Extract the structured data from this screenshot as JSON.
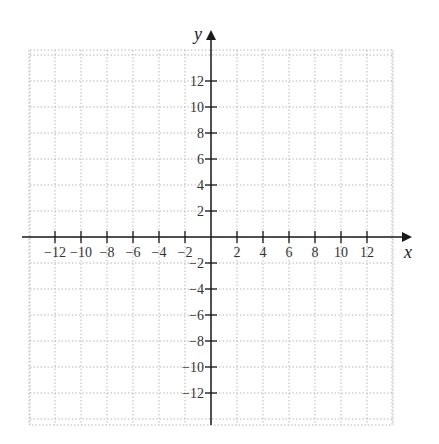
{
  "chart_data": {
    "type": "scatter",
    "title": "",
    "xlabel": "x",
    "ylabel": "y",
    "xlim": [
      -14,
      14
    ],
    "ylim": [
      -14,
      14
    ],
    "grid": true,
    "grid_style": "dotted",
    "x_ticks": [
      -12,
      -10,
      -8,
      -6,
      -4,
      -2,
      2,
      4,
      6,
      8,
      10,
      12
    ],
    "y_ticks": [
      12,
      10,
      8,
      6,
      4,
      2,
      -2,
      -4,
      -6,
      -8,
      -10,
      -12
    ],
    "x_tick_labels": [
      "−12",
      "−10",
      "−8",
      "−6",
      "−4",
      "−2",
      "2",
      "4",
      "6",
      "8",
      "10",
      "12"
    ],
    "y_tick_labels": [
      "12",
      "10",
      "8",
      "6",
      "4",
      "2",
      "−2",
      "−4",
      "−6",
      "−8",
      "−10",
      "−12"
    ],
    "series": [],
    "legend": null
  },
  "colors": {
    "axis": "#1a1a1a",
    "grid": "#b8b8b8",
    "text": "#333333"
  }
}
